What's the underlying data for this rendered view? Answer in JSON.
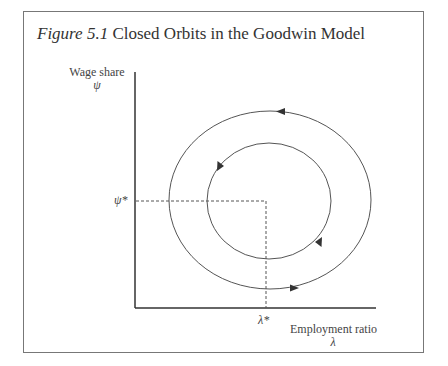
{
  "figure": {
    "number": "Figure 5.1",
    "title": "Closed Orbits in the Goodwin Model"
  },
  "axes": {
    "y_label": "Wage share",
    "y_symbol": "ψ",
    "x_label": "Employment ratio",
    "x_symbol": "λ",
    "y_equilibrium": "ψ*",
    "x_equilibrium": "λ*"
  },
  "orbits": [
    {
      "name": "outer",
      "cx": 270,
      "cy": 200,
      "rx": 101,
      "ry": 89,
      "direction": "counterclockwise"
    },
    {
      "name": "inner",
      "cx": 269,
      "cy": 201,
      "rx": 62,
      "ry": 58,
      "direction": "counterclockwise"
    }
  ],
  "colors": {
    "line": "#555555",
    "frame": "#777777",
    "text": "#333333"
  }
}
